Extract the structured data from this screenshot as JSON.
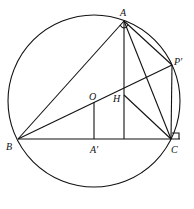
{
  "diagram": {
    "type": "geometry-circumcircle",
    "stroke_color": "#111111",
    "labels": {
      "A": "A",
      "B": "B",
      "C": "C",
      "O": "O",
      "H": "H",
      "A_prime": "A′",
      "P_prime": "P′"
    },
    "caption": ""
  }
}
